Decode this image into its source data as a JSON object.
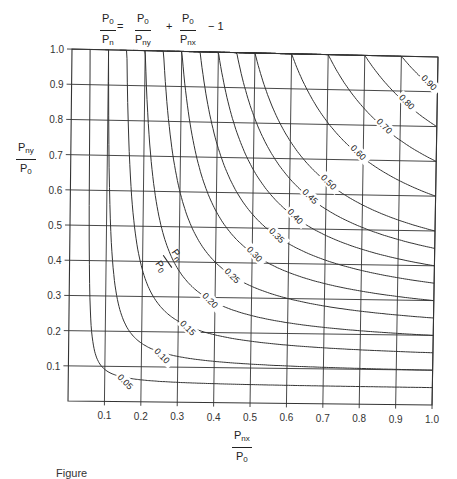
{
  "equation": {
    "lhs": {
      "num": "P",
      "num_sub": "0",
      "den": "P",
      "den_sub": "n"
    },
    "equals": "=",
    "term1": {
      "num": "P",
      "num_sub": "0",
      "den": "P",
      "den_sub": "ny"
    },
    "plus": "+",
    "term2": {
      "num": "P",
      "num_sub": "0",
      "den": "P",
      "den_sub": "nx"
    },
    "minus_one": "− 1"
  },
  "y_axis_label": {
    "num": "P",
    "num_sub": "ny",
    "den": "P",
    "den_sub": "0"
  },
  "x_axis_label": {
    "num": "P",
    "num_sub": "nx",
    "den": "P",
    "den_sub": "0"
  },
  "inline_label": {
    "num": "P",
    "num_sub": "n",
    "den": "P",
    "den_sub": "0"
  },
  "caption": "Figure",
  "chart_data": {
    "type": "line",
    "xlabel": "Pnx/P0",
    "ylabel": "Pny/P0",
    "xlim": [
      0,
      1.0
    ],
    "ylim": [
      0,
      1.0
    ],
    "x_ticks": [
      "0.1",
      "0.2",
      "0.3",
      "0.4",
      "0.5",
      "0.6",
      "0.7",
      "0.8",
      "0.9",
      "1.0"
    ],
    "y_ticks": [
      "0.1",
      "0.2",
      "0.3",
      "0.4",
      "0.5",
      "0.6",
      "0.7",
      "0.8",
      "0.9",
      "1.0"
    ],
    "grid": true,
    "contour_variable": "Pn/P0",
    "contour_levels": [
      0.05,
      0.1,
      0.15,
      0.2,
      0.25,
      0.3,
      0.35,
      0.4,
      0.45,
      0.5,
      0.6,
      0.7,
      0.8,
      0.9
    ],
    "contour_labels": [
      "0.05",
      "0.10",
      "0.15",
      "0.20",
      "0.25",
      "0.30",
      "0.35",
      "0.40",
      "0.45",
      "0.50",
      "0.60",
      "0.70",
      "0.80",
      "0.90"
    ],
    "equation": "1/(Pn/P0) = 1/(Pny/P0) + 1/(Pnx/P0) - 1"
  }
}
